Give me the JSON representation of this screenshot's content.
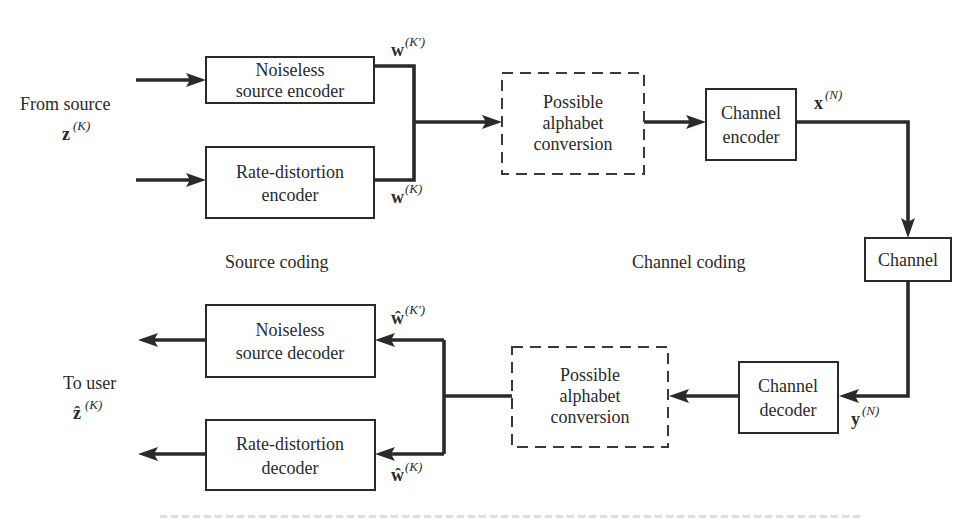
{
  "diagram": {
    "type": "block-diagram",
    "sections": {
      "source_coding": "Source coding",
      "channel_coding": "Channel coding"
    },
    "io": {
      "from_source": "From source",
      "from_source_symbol": "z",
      "from_source_sup": "(K)",
      "to_user": "To user",
      "to_user_symbol": "ẑ",
      "to_user_sup": "(K)"
    },
    "blocks": {
      "noiseless_encoder": [
        "Noiseless",
        "source encoder"
      ],
      "rd_encoder": [
        "Rate-distortion",
        "encoder"
      ],
      "alphabet_conv_top": [
        "Possible",
        "alphabet",
        "conversion"
      ],
      "channel_encoder": [
        "Channel",
        "encoder"
      ],
      "channel": [
        "Channel"
      ],
      "channel_decoder": [
        "Channel",
        "decoder"
      ],
      "alphabet_conv_bottom": [
        "Possible",
        "alphabet",
        "conversion"
      ],
      "noiseless_decoder": [
        "Noiseless",
        "source decoder"
      ],
      "rd_decoder": [
        "Rate-distortion",
        "decoder"
      ]
    },
    "signals": {
      "w_kprime": {
        "symbol": "w",
        "sup": "(K′)"
      },
      "w_k": {
        "symbol": "w",
        "sup": "(K)"
      },
      "x_n": {
        "symbol": "x",
        "sup": "(N)"
      },
      "y_n": {
        "symbol": "y",
        "sup": "(N)"
      },
      "what_kprime": {
        "symbol": "ŵ",
        "sup": "(K′)"
      },
      "what_k": {
        "symbol": "ŵ",
        "sup": "(K)"
      }
    },
    "colors": {
      "ink": "#2a2a2a",
      "background": "#ffffff"
    }
  }
}
